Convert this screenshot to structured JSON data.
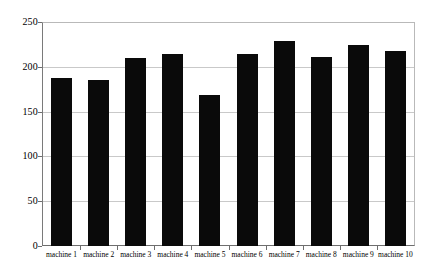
{
  "chart_data": {
    "type": "bar",
    "title": "",
    "subtitle": "",
    "xlabel": "",
    "ylabel": "",
    "categories": [
      "machine 1",
      "machine 2",
      "machine 3",
      "machine 4",
      "machine 5",
      "machine 6",
      "machine 7",
      "machine 8",
      "machine 9",
      "machine 10"
    ],
    "values": [
      188,
      185,
      210,
      214,
      169,
      214,
      229,
      211,
      224,
      218
    ],
    "ylim": [
      0,
      250
    ],
    "yticks": [
      0,
      50,
      100,
      150,
      200,
      250
    ],
    "ytick_labels": [
      "0",
      "50",
      "100",
      "150",
      "200",
      "250"
    ],
    "grid": true,
    "grid_axis": "y",
    "legend": false,
    "legend_position": "none",
    "bar_color": "#0a0a0a",
    "grid_color": "#c9c9c9",
    "axis_color": "#6e6e6e",
    "plot_background": "#ffffff"
  }
}
